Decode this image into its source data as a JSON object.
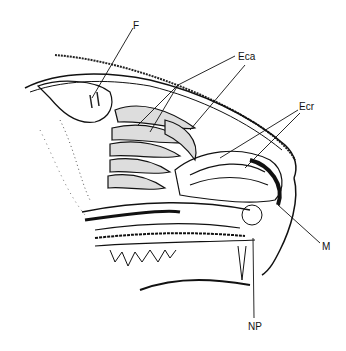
{
  "figure": {
    "labels": [
      {
        "id": "F",
        "text": "F",
        "x": 133,
        "y": 21
      },
      {
        "id": "Eca",
        "text": "Eca",
        "x": 238,
        "y": 52
      },
      {
        "id": "Ecr",
        "text": "Ecr",
        "x": 299,
        "y": 102
      },
      {
        "id": "M",
        "text": "M",
        "x": 322,
        "y": 242
      },
      {
        "id": "NP",
        "text": "NP",
        "x": 248,
        "y": 322
      }
    ]
  }
}
